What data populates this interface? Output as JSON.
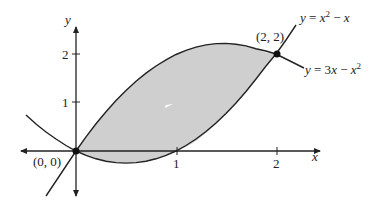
{
  "figure": {
    "axes": {
      "x_label": "x",
      "y_label": "y",
      "x_ticks": [
        {
          "value": 1,
          "label": "1"
        },
        {
          "value": 2,
          "label": "2"
        }
      ],
      "y_ticks": [
        {
          "value": 1,
          "label": "1"
        },
        {
          "value": 2,
          "label": "2"
        }
      ]
    },
    "curves": [
      {
        "id": "upper",
        "label": "y = 3x − x²",
        "label_parts": {
          "lhs": "y",
          "eq": " = 3",
          "x": "x",
          "minus": " − ",
          "x2": "x",
          "sup": "2"
        }
      },
      {
        "id": "lower",
        "label": "y = x² − x",
        "label_parts": {
          "lhs": "y",
          "eq": " = ",
          "x": "x",
          "sup": "2",
          "minus": " − ",
          "x2": "x"
        }
      }
    ],
    "points": [
      {
        "label": "(0, 0)",
        "x": 0,
        "y": 0
      },
      {
        "label": "(2, 2)",
        "x": 2,
        "y": 2
      }
    ],
    "shaded_region": {
      "from_x": 0,
      "to_x": 2,
      "fill": "#cfcfcf"
    }
  },
  "colors": {
    "line": "#222222",
    "shade": "#cfcfcf"
  }
}
